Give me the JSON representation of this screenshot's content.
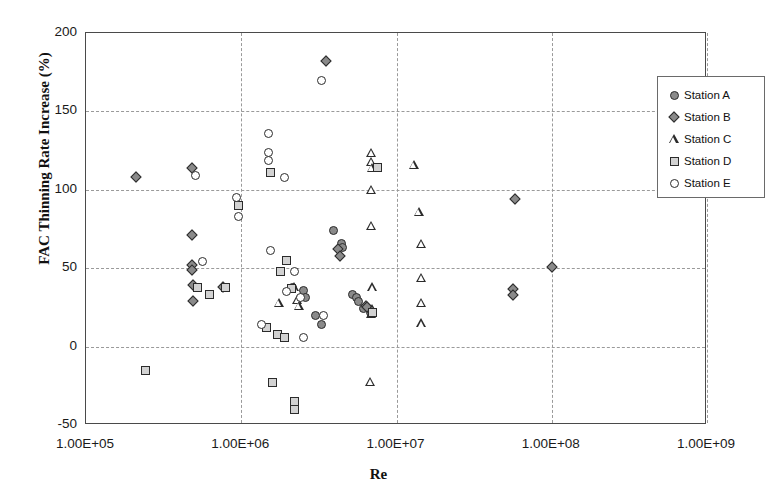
{
  "chart_data": {
    "type": "scatter",
    "title": "",
    "xlabel": "Re",
    "ylabel": "FAC Thinning Rate Increase (%)",
    "xscale": "log",
    "yscale": "linear",
    "xlim": [
      100000,
      1000000000
    ],
    "ylim": [
      -50,
      200
    ],
    "xticks": [
      "1.00E+05",
      "1.00E+06",
      "1.00E+07",
      "1.00E+08",
      "1.00E+09"
    ],
    "xtick_values": [
      100000,
      1000000,
      10000000,
      100000000,
      1000000000
    ],
    "yticks": [
      "200",
      "150",
      "100",
      "50",
      "0",
      "-50"
    ],
    "ytick_values": [
      200,
      150,
      100,
      50,
      0,
      -50
    ],
    "grid": true,
    "legend_position": "top-right",
    "series": [
      {
        "name": "Station A",
        "marker": "circle-filled",
        "points": [
          [
            3900000,
            74
          ],
          [
            4400000,
            66
          ],
          [
            4500000,
            63
          ],
          [
            5200000,
            33
          ],
          [
            5500000,
            31
          ],
          [
            5700000,
            29
          ],
          [
            6100000,
            24
          ],
          [
            6800000,
            22
          ],
          [
            2500000,
            36
          ],
          [
            2600000,
            31
          ],
          [
            3000000,
            20
          ],
          [
            3300000,
            14
          ],
          [
            2150000,
            38
          ]
        ]
      },
      {
        "name": "Station B",
        "marker": "diamond",
        "points": [
          [
            210000,
            108
          ],
          [
            480000,
            114
          ],
          [
            480000,
            71
          ],
          [
            480000,
            52
          ],
          [
            480000,
            49
          ],
          [
            490000,
            39
          ],
          [
            490000,
            29
          ],
          [
            760000,
            38
          ],
          [
            3500000,
            182
          ],
          [
            4200000,
            62
          ],
          [
            4300000,
            58
          ],
          [
            6400000,
            26
          ],
          [
            6500000,
            25
          ],
          [
            58000000,
            94
          ],
          [
            56000000,
            37
          ],
          [
            56000000,
            33
          ],
          [
            100000000,
            51
          ]
        ]
      },
      {
        "name": "Station C",
        "marker": "triangle",
        "points": [
          [
            1750000,
            28
          ],
          [
            2200000,
            38
          ],
          [
            2300000,
            30
          ],
          [
            2350000,
            26
          ],
          [
            6900000,
            124
          ],
          [
            6900000,
            118
          ],
          [
            6950000,
            114
          ],
          [
            6900000,
            100
          ],
          [
            6900000,
            77
          ],
          [
            7000000,
            38
          ],
          [
            7000000,
            24
          ],
          [
            6900000,
            21
          ],
          [
            6800000,
            -22
          ],
          [
            13000000,
            116
          ],
          [
            14000000,
            86
          ],
          [
            14500000,
            66
          ],
          [
            14500000,
            44
          ],
          [
            14500000,
            28
          ],
          [
            14500000,
            15
          ]
        ]
      },
      {
        "name": "Station D",
        "marker": "square",
        "points": [
          [
            240000,
            -15
          ],
          [
            520000,
            38
          ],
          [
            620000,
            33
          ],
          [
            960000,
            90
          ],
          [
            1550000,
            111
          ],
          [
            1800000,
            48
          ],
          [
            1950000,
            55
          ],
          [
            790000,
            38
          ],
          [
            1450000,
            12
          ],
          [
            1700000,
            8
          ],
          [
            1900000,
            6
          ],
          [
            1600000,
            -23
          ],
          [
            2200000,
            -35
          ],
          [
            2200000,
            -40
          ],
          [
            2100000,
            37
          ],
          [
            7600000,
            114
          ],
          [
            7000000,
            22
          ]
        ]
      },
      {
        "name": "Station E",
        "marker": "circle-open",
        "points": [
          [
            510000,
            109
          ],
          [
            560000,
            54
          ],
          [
            930000,
            95
          ],
          [
            960000,
            83
          ],
          [
            1500000,
            136
          ],
          [
            1500000,
            124
          ],
          [
            1500000,
            119
          ],
          [
            1900000,
            108
          ],
          [
            1550000,
            61
          ],
          [
            1350000,
            14
          ],
          [
            2200000,
            48
          ],
          [
            2400000,
            31
          ],
          [
            2500000,
            6
          ],
          [
            3300000,
            170
          ],
          [
            3400000,
            20
          ],
          [
            1950000,
            35
          ]
        ]
      }
    ]
  },
  "legend": {
    "items": [
      {
        "label": "Station A",
        "marker": "circle-filled"
      },
      {
        "label": "Station B",
        "marker": "diamond"
      },
      {
        "label": "Station C",
        "marker": "triangle"
      },
      {
        "label": "Station D",
        "marker": "square"
      },
      {
        "label": "Station E",
        "marker": "circle-open"
      }
    ]
  }
}
